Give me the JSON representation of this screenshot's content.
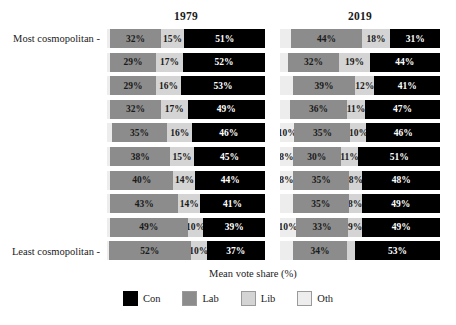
{
  "chart_data": {
    "type": "bar",
    "subtype": "stacked-horizontal-100pct",
    "title": "",
    "xlabel": "Mean vote share (%)",
    "ylabel": "",
    "xlim": [
      0,
      100
    ],
    "grid": false,
    "legend_position": "bottom",
    "facets": [
      {
        "key": "y1979",
        "label": "1979"
      },
      {
        "key": "y2019",
        "label": "2019"
      }
    ],
    "categories": [
      "Most cosmopolitan",
      "decile 2",
      "decile 3",
      "decile 4",
      "decile 5",
      "decile 6",
      "decile 7",
      "decile 8",
      "decile 9",
      "Least cosmopolitan"
    ],
    "axis_labels": {
      "top": "Most cosmopolitan -",
      "bottom": "Least cosmopolitan -"
    },
    "legend": [
      {
        "name": "Con",
        "color": "#000000"
      },
      {
        "name": "Lab",
        "color": "#8c8c8c"
      },
      {
        "name": "Lib",
        "color": "#d4d4d4"
      },
      {
        "name": "Oth",
        "color": "#ededed"
      }
    ],
    "series": [
      {
        "name": "Oth",
        "class": "oth"
      },
      {
        "name": "Lab",
        "class": "lab"
      },
      {
        "name": "Lib",
        "class": "lib"
      },
      {
        "name": "Con",
        "class": "con"
      }
    ],
    "panels": {
      "y1979": [
        {
          "oth": 2,
          "lab": 32,
          "lib": 15,
          "con": 51,
          "labels": {
            "oth": "",
            "lab": "32%",
            "lib": "15%",
            "con": "51%"
          }
        },
        {
          "oth": 2,
          "lab": 29,
          "lib": 17,
          "con": 52,
          "labels": {
            "oth": "",
            "lab": "29%",
            "lib": "17%",
            "con": "52%"
          }
        },
        {
          "oth": 2,
          "lab": 29,
          "lib": 16,
          "con": 53,
          "labels": {
            "oth": "",
            "lab": "29%",
            "lib": "16%",
            "con": "53%"
          }
        },
        {
          "oth": 2,
          "lab": 32,
          "lib": 17,
          "con": 49,
          "labels": {
            "oth": "",
            "lab": "32%",
            "lib": "17%",
            "con": "49%"
          }
        },
        {
          "oth": 3,
          "lab": 35,
          "lib": 16,
          "con": 46,
          "labels": {
            "oth": "",
            "lab": "35%",
            "lib": "16%",
            "con": "46%"
          }
        },
        {
          "oth": 2,
          "lab": 38,
          "lib": 15,
          "con": 45,
          "labels": {
            "oth": "",
            "lab": "38%",
            "lib": "15%",
            "con": "45%"
          }
        },
        {
          "oth": 2,
          "lab": 40,
          "lib": 14,
          "con": 44,
          "labels": {
            "oth": "",
            "lab": "40%",
            "lib": "14%",
            "con": "44%"
          }
        },
        {
          "oth": 2,
          "lab": 43,
          "lib": 14,
          "con": 41,
          "labels": {
            "oth": "",
            "lab": "43%",
            "lib": "14%",
            "con": "41%"
          }
        },
        {
          "oth": 2,
          "lab": 49,
          "lib": 10,
          "con": 39,
          "labels": {
            "oth": "",
            "lab": "49%",
            "lib": "10%",
            "con": "39%"
          }
        },
        {
          "oth": 1,
          "lab": 52,
          "lib": 10,
          "con": 37,
          "labels": {
            "oth": "",
            "lab": "52%",
            "lib": "10%",
            "con": "37%"
          }
        }
      ],
      "y2019": [
        {
          "oth": 7,
          "lab": 44,
          "lib": 18,
          "con": 31,
          "labels": {
            "oth": "",
            "lab": "44%",
            "lib": "18%",
            "con": "31%"
          }
        },
        {
          "oth": 5,
          "lab": 32,
          "lib": 19,
          "con": 44,
          "labels": {
            "oth": "",
            "lab": "32%",
            "lib": "19%",
            "con": "44%"
          }
        },
        {
          "oth": 8,
          "lab": 39,
          "lib": 12,
          "con": 41,
          "labels": {
            "oth": "",
            "lab": "39%",
            "lib": "12%",
            "con": "41%"
          }
        },
        {
          "oth": 6,
          "lab": 36,
          "lib": 11,
          "con": 47,
          "labels": {
            "oth": "",
            "lab": "36%",
            "lib": "11%",
            "con": "47%"
          }
        },
        {
          "oth": 9,
          "lab": 35,
          "lib": 10,
          "con": 46,
          "labels": {
            "oth": "10%",
            "lab": "35%",
            "lib": "10%",
            "con": "46%"
          }
        },
        {
          "oth": 8,
          "lab": 30,
          "lib": 11,
          "con": 51,
          "labels": {
            "oth": "8%",
            "lab": "30%",
            "lib": "11%",
            "con": "51%"
          }
        },
        {
          "oth": 8,
          "lab": 35,
          "lib": 8,
          "con": 48,
          "labels": {
            "oth": "8%",
            "lab": "35%",
            "lib": "8%",
            "con": "48%"
          }
        },
        {
          "oth": 8,
          "lab": 35,
          "lib": 8,
          "con": 49,
          "labels": {
            "oth": "",
            "lab": "35%",
            "lib": "8%",
            "con": "49%"
          }
        },
        {
          "oth": 10,
          "lab": 33,
          "lib": 9,
          "con": 49,
          "labels": {
            "oth": "10%",
            "lab": "33%",
            "lib": "9%",
            "con": "49%"
          }
        },
        {
          "oth": 8,
          "lab": 34,
          "lib": 5,
          "con": 53,
          "labels": {
            "oth": "",
            "lab": "34%",
            "lib": "",
            "con": "53%"
          }
        }
      ]
    }
  }
}
